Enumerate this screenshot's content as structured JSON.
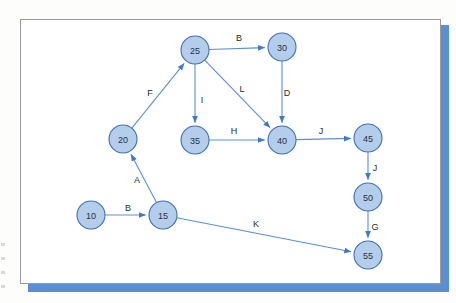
{
  "figure": {
    "type": "directed-graph",
    "background": "#fdfdfc",
    "card_background": "#ffffff",
    "card_border_color": "#9a9a9a",
    "shadow_color": "#5b8fd4"
  },
  "style": {
    "node_fill": "#b3cdea",
    "node_stroke": "#3f6fb5",
    "edge_color": "#5b8fd4",
    "node_radius": 14
  },
  "chart_data": {
    "type": "diagram",
    "title": "",
    "nodes": [
      {
        "id": "10",
        "label": "10",
        "x": 91,
        "y": 215
      },
      {
        "id": "15",
        "label": "15",
        "x": 163,
        "y": 215
      },
      {
        "id": "20",
        "label": "20",
        "x": 123,
        "y": 139
      },
      {
        "id": "25",
        "label": "25",
        "x": 195,
        "y": 50
      },
      {
        "id": "30",
        "label": "30",
        "x": 282,
        "y": 47
      },
      {
        "id": "35",
        "label": "35",
        "x": 195,
        "y": 140
      },
      {
        "id": "40",
        "label": "40",
        "x": 282,
        "y": 140
      },
      {
        "id": "45",
        "label": "45",
        "x": 368,
        "y": 138
      },
      {
        "id": "50",
        "label": "50",
        "x": 368,
        "y": 197
      },
      {
        "id": "55",
        "label": "55",
        "x": 368,
        "y": 255
      }
    ],
    "edges": [
      {
        "from": "10",
        "to": "15",
        "label": "B",
        "lx": 128,
        "ly": 208
      },
      {
        "from": "15",
        "to": "20",
        "label": "A",
        "lx": 137,
        "ly": 180
      },
      {
        "from": "20",
        "to": "25",
        "label": "F",
        "lx": 150,
        "ly": 93
      },
      {
        "from": "25",
        "to": "30",
        "label": "B",
        "lx": 239,
        "ly": 38
      },
      {
        "from": "25",
        "to": "35",
        "label": "I",
        "lx": 202,
        "ly": 100
      },
      {
        "from": "25",
        "to": "40",
        "label": "L",
        "lx": 242,
        "ly": 89
      },
      {
        "from": "30",
        "to": "40",
        "label": "D",
        "lx": 287,
        "ly": 93
      },
      {
        "from": "35",
        "to": "40",
        "label": "H",
        "lx": 234,
        "ly": 131
      },
      {
        "from": "40",
        "to": "45",
        "label": "J",
        "lx": 321,
        "ly": 131
      },
      {
        "from": "45",
        "to": "50",
        "label": "J",
        "lx": 375,
        "ly": 168
      },
      {
        "from": "50",
        "to": "55",
        "label": "G",
        "lx": 375,
        "ly": 227
      },
      {
        "from": "15",
        "to": "55",
        "label": "K",
        "lx": 256,
        "ly": 224
      }
    ]
  }
}
